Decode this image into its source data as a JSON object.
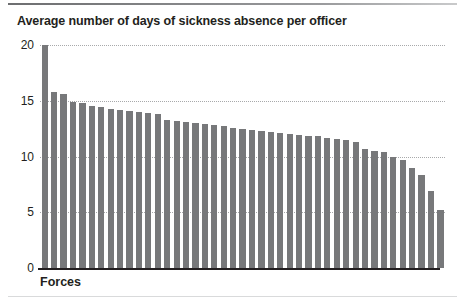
{
  "chart_data": {
    "type": "bar",
    "title": "Average number of days of sickness absence per officer",
    "xlabel": "Forces",
    "ylabel": "",
    "ylim": [
      0,
      20
    ],
    "yticks": [
      0,
      5,
      10,
      15,
      20
    ],
    "ytick_labels": [
      "0",
      "5",
      "10",
      "15",
      "20"
    ],
    "grid": true,
    "legend": false,
    "bar_color": "#77787a",
    "categories": [
      "1",
      "2",
      "3",
      "4",
      "5",
      "6",
      "7",
      "8",
      "9",
      "10",
      "11",
      "12",
      "13",
      "14",
      "15",
      "16",
      "17",
      "18",
      "19",
      "20",
      "21",
      "22",
      "23",
      "24",
      "25",
      "26",
      "27",
      "28",
      "29",
      "30",
      "31",
      "32",
      "33",
      "34",
      "35",
      "36",
      "37",
      "38",
      "39",
      "40",
      "41",
      "42",
      "43"
    ],
    "values": [
      20.0,
      15.8,
      15.6,
      14.9,
      14.8,
      14.5,
      14.4,
      14.3,
      14.2,
      14.1,
      14.0,
      13.9,
      13.8,
      13.3,
      13.2,
      13.1,
      13.0,
      12.9,
      12.8,
      12.7,
      12.6,
      12.5,
      12.4,
      12.3,
      12.2,
      12.1,
      12.0,
      11.9,
      11.8,
      11.8,
      11.7,
      11.6,
      11.5,
      11.3,
      10.7,
      10.5,
      10.4,
      10.0,
      9.7,
      9.0,
      8.3,
      6.9,
      5.2
    ]
  }
}
